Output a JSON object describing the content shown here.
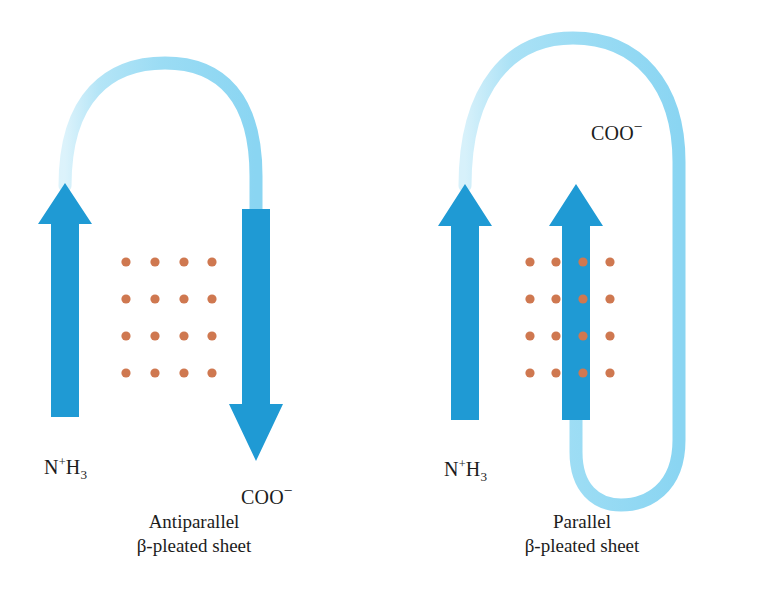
{
  "figure": {
    "background_color": "#ffffff",
    "ribbon_color_dark": "#1f9ad4",
    "ribbon_color_light": "#9bdcf4",
    "hbond_dot_color": "#cf7850",
    "text_color": "#1c1c1c"
  },
  "panels": [
    {
      "id": "antiparallel",
      "caption_line1": "Antiparallel",
      "caption_line2": "β-pleated sheet",
      "strands": [
        {
          "id": "strand-1",
          "direction": "up",
          "terminus": "N-terminus"
        },
        {
          "id": "strand-2",
          "direction": "down",
          "terminus": "C-terminus"
        }
      ],
      "labels": {
        "n_terminus": {
          "text": "N⁺H₃",
          "base": "N",
          "sup": "+",
          "elem": "H",
          "sub": "3"
        },
        "c_terminus": {
          "text": "COO⁻",
          "base": "COO",
          "sup": "−"
        }
      },
      "hbond_grid": {
        "rows": 4,
        "cols": 4,
        "dot_radius": 4.6
      }
    },
    {
      "id": "parallel",
      "caption_line1": "Parallel",
      "caption_line2": "β-pleated sheet",
      "strands": [
        {
          "id": "strand-1",
          "direction": "up",
          "terminus": "N-terminus"
        },
        {
          "id": "strand-2",
          "direction": "up",
          "terminus": "C-terminus"
        }
      ],
      "labels": {
        "n_terminus": {
          "text": "N⁺H₃",
          "base": "N",
          "sup": "+",
          "elem": "H",
          "sub": "3"
        },
        "c_terminus": {
          "text": "COO⁻",
          "base": "COO",
          "sup": "−"
        }
      },
      "hbond_grid": {
        "rows": 4,
        "cols": 4,
        "dot_radius": 4.6
      }
    }
  ]
}
